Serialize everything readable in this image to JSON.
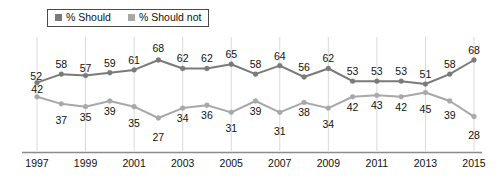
{
  "legend": {
    "items": [
      {
        "label": "% Should",
        "color": "#7a7a7a",
        "key": "should"
      },
      {
        "label": "% Should not",
        "color": "#a8a8a8",
        "key": "should_not"
      }
    ]
  },
  "axis": {
    "tick_labels": [
      "1997",
      "1999",
      "2001",
      "2003",
      "2005",
      "2007",
      "2009",
      "2011",
      "2013",
      "2015"
    ],
    "axis_color": "#8c8c8c",
    "gridline_color": "#d9d9d9"
  },
  "chart_data": {
    "type": "line",
    "title": "",
    "subtitle": "",
    "xlabel": "",
    "ylabel": "",
    "grid": "vertical-only",
    "legend_position": "top-left",
    "ylim": [
      20,
      75
    ],
    "xlim": [
      1997,
      2015
    ],
    "x": [
      1997,
      1998,
      1999,
      2000,
      2001,
      2002,
      2003,
      2004,
      2005,
      2006,
      2007,
      2008,
      2009,
      2010,
      2011,
      2012,
      2013,
      2014,
      2015
    ],
    "tick_years": [
      1997,
      1999,
      2001,
      2003,
      2005,
      2007,
      2009,
      2011,
      2013,
      2015
    ],
    "series": [
      {
        "name": "% Should",
        "color": "#7a7a7a",
        "values": [
          52,
          58,
          57,
          59,
          61,
          68,
          62,
          62,
          65,
          58,
          64,
          56,
          62,
          53,
          53,
          53,
          51,
          58,
          68
        ],
        "label_side": "above"
      },
      {
        "name": "% Should not",
        "color": "#a8a8a8",
        "values": [
          42,
          37,
          35,
          39,
          35,
          27,
          34,
          36,
          31,
          39,
          31,
          38,
          34,
          42,
          43,
          42,
          45,
          39,
          28
        ],
        "label_side": "below"
      }
    ]
  }
}
